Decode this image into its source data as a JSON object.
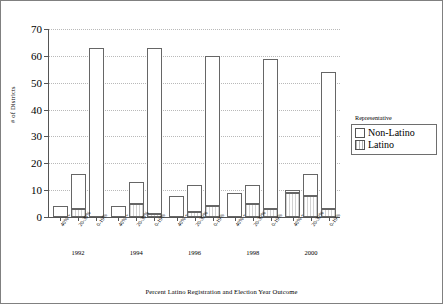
{
  "chart_data": {
    "type": "bar",
    "stacked": true,
    "title": "",
    "xlabel": "Percent Latino Registration and Election Year Outcome",
    "ylabel": "# of Districts",
    "ylim": [
      0,
      70
    ],
    "ytick_step": 10,
    "yticks": [
      0,
      10,
      20,
      30,
      40,
      50,
      60,
      70
    ],
    "grid": true,
    "legend_title": "Representative",
    "legend_position": "right",
    "series": [
      {
        "name": "Non-Latino",
        "style": "open"
      },
      {
        "name": "Latino",
        "style": "hatched"
      }
    ],
    "group_labels": [
      "1992",
      "1994",
      "1996",
      "1998",
      "2000"
    ],
    "categories": [
      "40% +",
      "20-39%",
      "0-19%"
    ],
    "groups": [
      {
        "year": "1992",
        "bars": [
          {
            "category": "40% +",
            "latino": 0,
            "non_latino": 4,
            "labels": {
              "non_latino": "4"
            }
          },
          {
            "category": "20-39%",
            "latino": 3,
            "non_latino": 13,
            "labels": {
              "latino": "3",
              "non_latino": "13"
            }
          },
          {
            "category": "0-19%",
            "latino": 0,
            "non_latino": 63,
            "labels": {
              "non_latino": "63"
            }
          }
        ]
      },
      {
        "year": "1994",
        "bars": [
          {
            "category": "40% +",
            "latino": 0,
            "non_latino": 4,
            "labels": {
              "non_latino": "4"
            }
          },
          {
            "category": "20-39%",
            "latino": 5,
            "non_latino": 8,
            "labels": {
              "latino": "5",
              "non_latino": "8"
            }
          },
          {
            "category": "0-19%",
            "latino": 1,
            "non_latino": 62,
            "labels": {
              "latino": "1",
              "non_latino": "62"
            }
          }
        ]
      },
      {
        "year": "1996",
        "bars": [
          {
            "category": "40% +",
            "latino": 0,
            "non_latino": 8,
            "labels": {
              "non_latino": "8"
            }
          },
          {
            "category": "20-39%",
            "latino": 2,
            "non_latino": 10,
            "labels": {
              "latino": "2",
              "non_latino": "10"
            }
          },
          {
            "category": "0-19%",
            "latino": 4,
            "non_latino": 56,
            "labels": {
              "latino": "4",
              "non_latino": "56"
            }
          }
        ]
      },
      {
        "year": "1998",
        "bars": [
          {
            "category": "40% +",
            "latino": 0,
            "non_latino": 9,
            "labels": {
              "non_latino": "9"
            }
          },
          {
            "category": "20-39%",
            "latino": 5,
            "non_latino": 7,
            "labels": {
              "latino": "5",
              "non_latino": "7"
            }
          },
          {
            "category": "0-19%",
            "latino": 3,
            "non_latino": 56,
            "labels": {
              "latino": "3",
              "non_latino": "56"
            }
          }
        ]
      },
      {
        "year": "2000",
        "bars": [
          {
            "category": "40% +",
            "latino": 9,
            "non_latino": 1,
            "labels": {
              "latino": "9",
              "non_latino": "1"
            }
          },
          {
            "category": "20-39%",
            "latino": 8,
            "non_latino": 8,
            "labels": {
              "latino": "8",
              "non_latino": "8"
            }
          },
          {
            "category": "0-19%",
            "latino": 3,
            "non_latino": 51,
            "labels": {
              "latino": "3",
              "non_latino": "51"
            }
          }
        ]
      }
    ]
  },
  "axes": {
    "ylabel": "# of Districts",
    "xlabel": "Percent Latino Registration and Election Year Outcome"
  },
  "legend": {
    "title": "Representative",
    "items": [
      {
        "label": "Non-Latino",
        "swatch": "open-square-icon"
      },
      {
        "label": "Latino",
        "swatch": "hatched-square-icon"
      }
    ]
  }
}
